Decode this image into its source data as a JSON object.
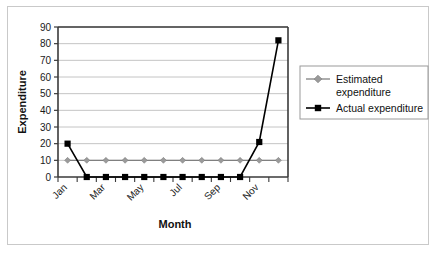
{
  "chart_data": {
    "type": "line",
    "title": "",
    "xlabel": "Month",
    "ylabel": "Expenditure",
    "categories": [
      "Jan",
      "Feb",
      "Mar",
      "Apr",
      "May",
      "Jun",
      "Jul",
      "Aug",
      "Sep",
      "Oct",
      "Nov",
      "Dec"
    ],
    "tick_labels_shown": [
      "Jan",
      "Mar",
      "May",
      "Jul",
      "Sep",
      "Nov"
    ],
    "yticks": [
      0,
      10,
      20,
      30,
      40,
      50,
      60,
      70,
      80,
      90
    ],
    "ylim": [
      0,
      90
    ],
    "grid": "horizontal",
    "legend_position": "right",
    "series": [
      {
        "name": "Estimated expenditure",
        "legend_label_line1": "Estimated",
        "legend_label_line2": "expenditure",
        "color": "#808080",
        "marker": "diamond",
        "values": [
          10,
          10,
          10,
          10,
          10,
          10,
          10,
          10,
          10,
          10,
          10,
          10
        ]
      },
      {
        "name": "Actual expenditure",
        "legend_label_line1": "Actual expenditure",
        "legend_label_line2": "",
        "color": "#000000",
        "marker": "square",
        "values": [
          20,
          0,
          0,
          0,
          0,
          0,
          0,
          0,
          0,
          0,
          21,
          82
        ]
      }
    ]
  },
  "colors": {
    "estimated": "#808080",
    "actual": "#000000",
    "gridline": "#b5b5b5",
    "axis": "#3a3a3a",
    "frame_border": "#c9c9c9",
    "legend_border": "#9a9a9a",
    "background": "#ffffff"
  },
  "legend": {
    "items": [
      {
        "label_line1": "Estimated",
        "label_line2": "expenditure",
        "marker": "diamond-marker",
        "color": "#808080"
      },
      {
        "label_line1": "Actual expenditure",
        "label_line2": "",
        "marker": "square-marker",
        "color": "#000000"
      }
    ]
  }
}
